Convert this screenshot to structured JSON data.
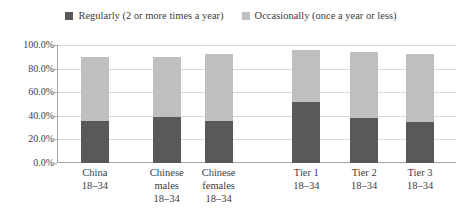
{
  "chart_data": {
    "type": "bar",
    "subtype": "stacked",
    "title": "",
    "xlabel": "",
    "ylabel": "",
    "ylim": [
      0,
      100
    ],
    "ytick_labels": [
      "100.0%",
      "80.0%",
      "60.0%",
      "40.0%",
      "20.0%",
      "0.0%"
    ],
    "ytick_values": [
      100,
      80,
      60,
      40,
      20,
      0
    ],
    "grid": true,
    "legend_position": "top-center",
    "categories": [
      "China\n18–34",
      "Chinese males\n18–34",
      "Chinese females\n18–34",
      "Tier 1\n18–34",
      "Tier 2\n18–34",
      "Tier 3\n18–34"
    ],
    "category_lines": [
      [
        "China",
        "18–34"
      ],
      [
        "Chinese",
        "males",
        "18–34"
      ],
      [
        "Chinese",
        "females",
        "18–34"
      ],
      [
        "Tier 1",
        "18–34"
      ],
      [
        "Tier 2",
        "18–34"
      ],
      [
        "Tier 3",
        "18–34"
      ]
    ],
    "series": [
      {
        "name": "Regularly (2 or more times a year)",
        "color": "#595959",
        "values": [
          36,
          39,
          36,
          52,
          38,
          35
        ]
      },
      {
        "name": "Occasionally (once a year or less)",
        "color": "#bfbfbf",
        "values": [
          54,
          51,
          56,
          44,
          56,
          57
        ]
      }
    ],
    "totals": [
      90,
      90,
      92,
      96,
      94,
      92
    ]
  },
  "legend": {
    "entries": [
      {
        "label": "Regularly (2 or more times a year)",
        "color": "#595959",
        "marker": "square-swatch"
      },
      {
        "label": "Occasionally (once a year or less)",
        "color": "#bfbfbf",
        "marker": "square-swatch"
      }
    ]
  },
  "axis": {
    "gridline_color": "#d9d9d9",
    "axis_color": "#a6a6a6"
  }
}
